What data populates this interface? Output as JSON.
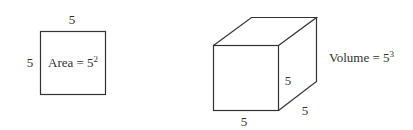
{
  "square": {
    "top_label": "5",
    "left_label": "5",
    "formula_base": "Area = 5",
    "formula_exponent": "2"
  },
  "cube": {
    "bottom_label": "5",
    "right_edge_label": "5",
    "depth_label": "5",
    "formula_base": "Volume = 5",
    "formula_exponent": "3"
  },
  "colors": {
    "stroke": "#333333",
    "background": "#ffffff"
  }
}
